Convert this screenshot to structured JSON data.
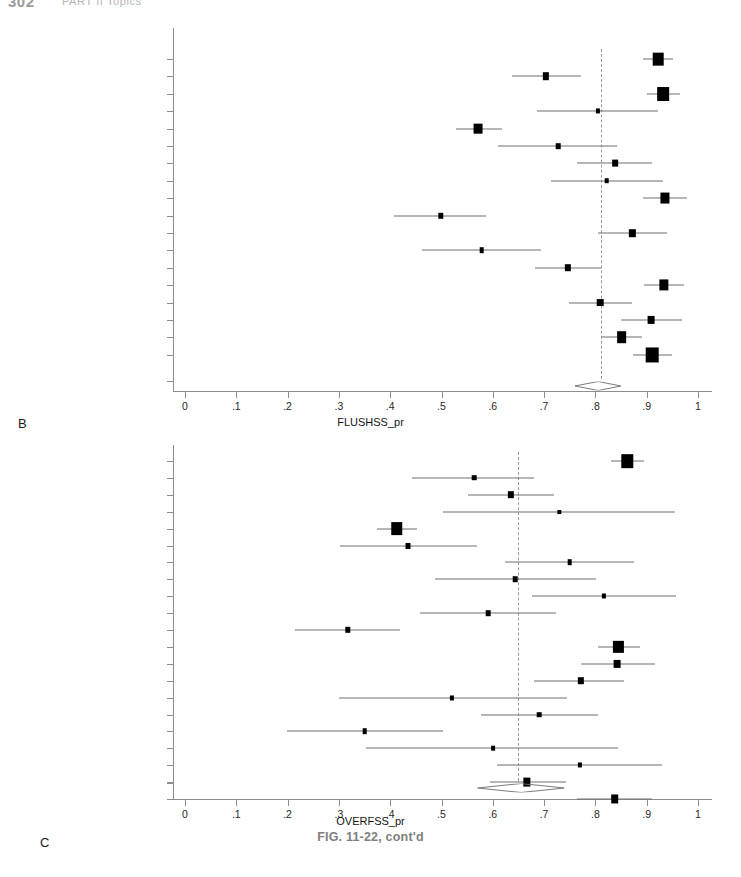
{
  "page": {
    "running_head": {
      "folio": "302",
      "title": "PART II  Topics"
    },
    "figure_caption": "FIG. 11-22, cont'd",
    "axis_color": "#8d8d8d",
    "marker_color": "#000000",
    "refline_color": "#9a9a9a"
  },
  "chart_data": [
    {
      "type": "scatter",
      "panel_letter": "B",
      "title": "",
      "xlabel": "FLUSHSS_pr",
      "ylabel": "",
      "xlim": [
        0,
        1
      ],
      "xticks": [
        0,
        0.1,
        0.2,
        0.3,
        0.4,
        0.5,
        0.6,
        0.7,
        0.8,
        0.9,
        1
      ],
      "xticklabels": [
        "0",
        ".1",
        ".2",
        ".3",
        ".4",
        ".5",
        ".6",
        ".7",
        ".8",
        ".9",
        "1"
      ],
      "grid": false,
      "legend": "none",
      "reference_line": 0.81,
      "annotations": [
        "Combined"
      ],
      "combined": {
        "label": "Combined",
        "estimate": 0.81,
        "ci_low": 0.76,
        "ci_high": 0.85
      },
      "studies": [
        {
          "label": "Harty et al. 1970",
          "estimate": 0.922,
          "ci_low": 0.893,
          "ci_high": 0.951,
          "weight": 3.1
        },
        {
          "label": "Heling and Tamshe 1970",
          "estimate": 0.703,
          "ci_low": 0.637,
          "ci_high": 0.772,
          "weight": 1.1
        },
        {
          "label": "Adenubi and Rule 1976",
          "estimate": 0.932,
          "ci_low": 0.9,
          "ci_high": 0.965,
          "weight": 3.8
        },
        {
          "label": "Heling and Shapira 1978",
          "estimate": 0.805,
          "ci_low": 0.686,
          "ci_high": 0.922,
          "weight": 0.5
        },
        {
          "label": "Jokinen et al. 1978",
          "estimate": 0.572,
          "ci_low": 0.528,
          "ci_high": 0.617,
          "weight": 2.2
        },
        {
          "label": "Kerekes 1978",
          "estimate": 0.727,
          "ci_low": 0.611,
          "ci_high": 0.842,
          "weight": 0.6
        },
        {
          "label": "Kerekes 1978",
          "estimate": 0.838,
          "ci_low": 0.764,
          "ci_high": 0.91,
          "weight": 0.9
        },
        {
          "label": "Heling and Kischinovsky 1979",
          "estimate": 0.822,
          "ci_low": 0.713,
          "ci_high": 0.932,
          "weight": 0.6
        },
        {
          "label": "Barbakow et al. 1980",
          "estimate": 0.935,
          "ci_low": 0.893,
          "ci_high": 0.978,
          "weight": 2.3
        },
        {
          "label": "Klevant and Eggink 1983",
          "estimate": 0.499,
          "ci_low": 0.408,
          "ci_high": 0.586,
          "weight": 0.8
        },
        {
          "label": "Halse and Molven 1987",
          "estimate": 0.872,
          "ci_low": 0.805,
          "ci_high": 0.94,
          "weight": 1.1
        },
        {
          "label": "Peak 1994",
          "estimate": 0.578,
          "ci_low": 0.462,
          "ci_high": 0.694,
          "weight": 0.6
        },
        {
          "label": "Hoskinson et al. 2002",
          "estimate": 0.746,
          "ci_low": 0.683,
          "ci_high": 0.81,
          "weight": 1.1
        },
        {
          "label": "Aqrabawi 2006",
          "estimate": 0.933,
          "ci_low": 0.894,
          "ci_high": 0.973,
          "weight": 2.4
        },
        {
          "label": "Doyle et al. 2006",
          "estimate": 0.809,
          "ci_low": 0.748,
          "ci_high": 0.871,
          "weight": 1.2
        },
        {
          "label": "Liang et al. 2011",
          "estimate": 0.909,
          "ci_low": 0.85,
          "ci_high": 0.969,
          "weight": 1.3
        },
        {
          "label": "Ng et al. 2011",
          "estimate": 0.851,
          "ci_low": 0.812,
          "ci_high": 0.89,
          "weight": 2.6
        },
        {
          "label": "Ricucci et al. 2011",
          "estimate": 0.911,
          "ci_low": 0.873,
          "ci_high": 0.949,
          "weight": 4.4
        }
      ]
    },
    {
      "type": "scatter",
      "panel_letter": "C",
      "title": "",
      "xlabel": "OVERFSS_pr",
      "ylabel": "",
      "xlim": [
        0,
        1
      ],
      "xticks": [
        0,
        0.1,
        0.2,
        0.3,
        0.4,
        0.5,
        0.6,
        0.7,
        0.8,
        0.9,
        1
      ],
      "xticklabels": [
        "0",
        ".1",
        ".2",
        ".3",
        ".4",
        ".5",
        ".6",
        ".7",
        ".8",
        ".9",
        "1"
      ],
      "grid": false,
      "legend": "none",
      "reference_line": 0.65,
      "annotations": [
        "Combined"
      ],
      "combined": {
        "label": "Combined",
        "estimate": 0.65,
        "ci_low": 0.57,
        "ci_high": 0.74
      },
      "studies": [
        {
          "label": "Harty et al.1970",
          "estimate": 0.862,
          "ci_low": 0.83,
          "ci_high": 0.895,
          "weight": 3.6
        },
        {
          "label": "Heling & Tamshe 1970",
          "estimate": 0.564,
          "ci_low": 0.443,
          "ci_high": 0.68,
          "weight": 0.6
        },
        {
          "label": "Adenubi & Rule 1976",
          "estimate": 0.635,
          "ci_low": 0.551,
          "ci_high": 0.72,
          "weight": 1.1
        },
        {
          "label": "Heling & Shapira 1978",
          "estimate": 0.73,
          "ci_low": 0.503,
          "ci_high": 0.955,
          "weight": 0.3
        },
        {
          "label": "Jokinen et al. 1978",
          "estimate": 0.413,
          "ci_low": 0.375,
          "ci_high": 0.452,
          "weight": 3.7
        },
        {
          "label": "Kerekes 1978",
          "estimate": 0.435,
          "ci_low": 0.302,
          "ci_high": 0.57,
          "weight": 0.7
        },
        {
          "label": "Kerekes 1978",
          "estimate": 0.75,
          "ci_low": 0.623,
          "ci_high": 0.876,
          "weight": 0.6
        },
        {
          "label": "Heling & Kischinovsky 1979",
          "estimate": 0.644,
          "ci_low": 0.487,
          "ci_high": 0.802,
          "weight": 0.6
        },
        {
          "label": "Barbakow et al. 1980",
          "estimate": 0.817,
          "ci_low": 0.677,
          "ci_high": 0.957,
          "weight": 0.5
        },
        {
          "label": "Boggia 1983",
          "estimate": 0.591,
          "ci_low": 0.459,
          "ci_high": 0.723,
          "weight": 0.6
        },
        {
          "label": "Klevant & Eggink 1983",
          "estimate": 0.317,
          "ci_low": 0.215,
          "ci_high": 0.419,
          "weight": 0.8
        },
        {
          "label": "Halse & Molven 1987",
          "estimate": 0.845,
          "ci_low": 0.806,
          "ci_high": 0.886,
          "weight": 2.9
        },
        {
          "label": "Sjogren et al. 1990",
          "estimate": 0.842,
          "ci_low": 0.772,
          "ci_high": 0.916,
          "weight": 1.3
        },
        {
          "label": "Cvek 1992",
          "estimate": 0.772,
          "ci_low": 0.68,
          "ci_high": 0.856,
          "weight": 1.1
        },
        {
          "label": "Peak 1994",
          "estimate": 0.521,
          "ci_low": 0.3,
          "ci_high": 0.744,
          "weight": 0.5
        },
        {
          "label": "Hoskinson et al. 2002",
          "estimate": 0.691,
          "ci_low": 0.577,
          "ci_high": 0.805,
          "weight": 0.6
        },
        {
          "label": "Aqrabawi 2006",
          "estimate": 0.35,
          "ci_low": 0.198,
          "ci_high": 0.502,
          "weight": 0.6
        },
        {
          "label": "Doyle et al. 2006",
          "estimate": 0.6,
          "ci_low": 0.353,
          "ci_high": 0.845,
          "weight": 0.4
        },
        {
          "label": "Liang et al. 2011",
          "estimate": 0.77,
          "ci_low": 0.608,
          "ci_high": 0.93,
          "weight": 0.5
        },
        {
          "label": "Ng et al. 2011",
          "estimate": 0.666,
          "ci_low": 0.594,
          "ci_high": 0.742,
          "weight": 1.5
        },
        {
          "label": "Ricucci et al. 2011",
          "estimate": 0.838,
          "ci_low": 0.765,
          "ci_high": 0.911,
          "weight": 1.6
        }
      ]
    }
  ]
}
